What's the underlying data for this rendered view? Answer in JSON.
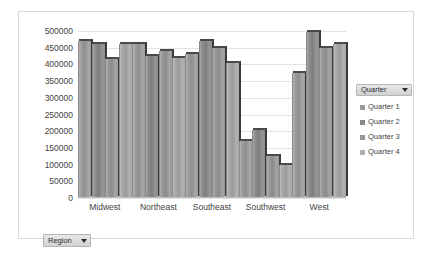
{
  "chart_data": {
    "type": "bar",
    "title": "",
    "subtitle": "",
    "xlabel": "Region",
    "ylabel": "",
    "categories": [
      "Midwest",
      "Northeast",
      "Southeast",
      "Southwest",
      "West"
    ],
    "series": [
      {
        "name": "Quarter 1",
        "values": [
          470000,
          460000,
          430000,
          172000,
          375000
        ],
        "color": "#9a9a9a"
      },
      {
        "name": "Quarter 2",
        "values": [
          460000,
          425000,
          470000,
          205000,
          498000
        ],
        "color": "#8a8a8a"
      },
      {
        "name": "Quarter 3",
        "values": [
          415000,
          440000,
          450000,
          125000,
          448000
        ],
        "color": "#969696"
      },
      {
        "name": "Quarter 4",
        "values": [
          460000,
          420000,
          405000,
          100000,
          460000
        ],
        "color": "#a6a6a6"
      }
    ],
    "ylim": [
      0,
      500000
    ],
    "yticks": [
      0,
      50000,
      100000,
      150000,
      200000,
      250000,
      300000,
      350000,
      400000,
      450000,
      500000
    ],
    "ytick_labels": [
      "0",
      "50000",
      "100000",
      "150000",
      "200000",
      "250000",
      "300000",
      "350000",
      "400000",
      "450000",
      "500000"
    ],
    "grid": true,
    "legend_position": "right",
    "legend_title": "Quarter"
  },
  "legend": {
    "header_label": "Quarter",
    "caret_icon": "chevron-down-icon",
    "items": [
      {
        "label": "Quarter 1",
        "color": "#9a9a9a"
      },
      {
        "label": "Quarter 2",
        "color": "#8a8a8a"
      },
      {
        "label": "Quarter 3",
        "color": "#969696"
      },
      {
        "label": "Quarter 4",
        "color": "#b0b0b0"
      }
    ]
  },
  "region_filter": {
    "label": "Region",
    "caret_icon": "chevron-down-icon"
  }
}
